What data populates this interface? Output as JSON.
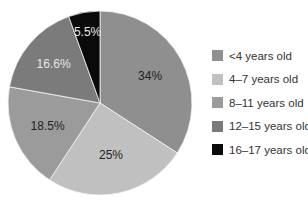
{
  "chart_data": {
    "type": "pie",
    "title": "",
    "categories": [
      "<4 years old",
      "4–7 years old",
      "8–11 years old",
      "12–15 years old",
      "16–17 years old"
    ],
    "values": [
      34,
      25,
      18.5,
      16.6,
      5.5
    ],
    "labels": [
      "34%",
      "25%",
      "18.5%",
      "16.6%",
      "5.5%"
    ],
    "colors": [
      "#8f8f8f",
      "#c0c0c0",
      "#9b9b9b",
      "#7b7b7b",
      "#0a0a0a"
    ],
    "label_colors": [
      "#222222",
      "#222222",
      "#222222",
      "#e6e6e6",
      "#e6e6e6"
    ],
    "start_angle_deg": 0,
    "direction": "clockwise",
    "legend_position": "right"
  },
  "legend": {
    "items": [
      {
        "label": "<4 years old"
      },
      {
        "label": "4–7 years old"
      },
      {
        "label": "8–11 years old"
      },
      {
        "label": "12–15 years old"
      },
      {
        "label": "16–17 years old"
      }
    ]
  }
}
